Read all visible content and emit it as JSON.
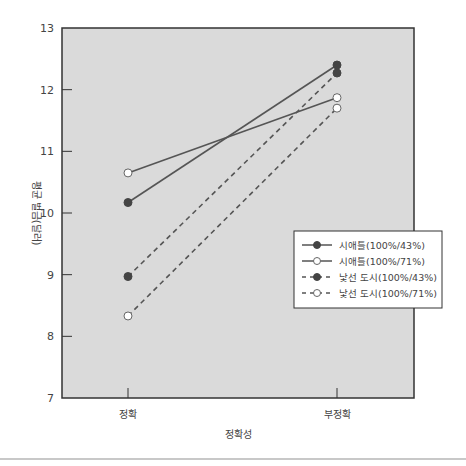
{
  "chart_data": {
    "type": "line",
    "title": "",
    "xlabel": "정확성",
    "ylabel": "평균 벌금(달러)",
    "categories": [
      "정확",
      "부정확"
    ],
    "ylim": [
      7,
      13
    ],
    "yticks": [
      7,
      8,
      9,
      10,
      11,
      12,
      13
    ],
    "grid": false,
    "legend_position": "right-middle",
    "series": [
      {
        "name": "시애틀(100%/43%)",
        "values": [
          10.17,
          12.4
        ],
        "line": "solid",
        "marker": "filled-circle"
      },
      {
        "name": "시애틀(100%/71%)",
        "values": [
          10.65,
          11.87
        ],
        "line": "solid",
        "marker": "open-circle"
      },
      {
        "name": "낯선 도시(100%/43%)",
        "values": [
          8.97,
          12.27
        ],
        "line": "dashed",
        "marker": "filled-circle"
      },
      {
        "name": "낯선 도시(100%/71%)",
        "values": [
          8.33,
          11.7
        ],
        "line": "dashed",
        "marker": "open-circle"
      }
    ],
    "colors": {
      "plot_background": "#dadada",
      "line": "#555555",
      "marker_fill": "#444444",
      "open_marker_fill": "#ffffff",
      "axis": "#333333"
    }
  }
}
